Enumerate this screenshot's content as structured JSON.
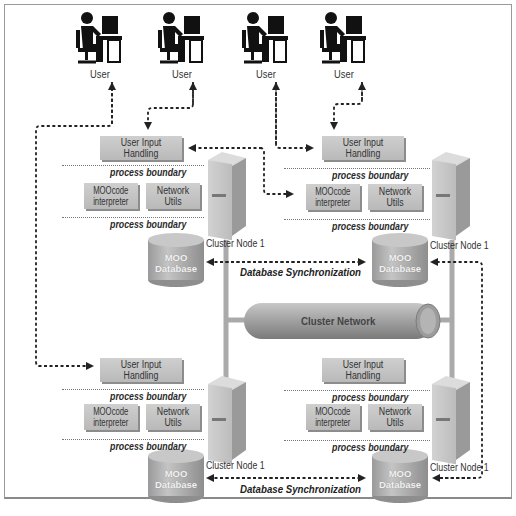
{
  "diagram": {
    "users": [
      {
        "label": "User"
      },
      {
        "label": "User"
      },
      {
        "label": "User"
      },
      {
        "label": "User"
      }
    ],
    "nodes": [
      {
        "id": "top-left",
        "input_box": "User Input Handling",
        "interpreter_box_line1": "MOOcode",
        "interpreter_box_line2": "interpreter",
        "network_box": "Network Utils",
        "boundary_top": "process boundary",
        "boundary_bottom": "process boundary",
        "server_label": "Cluster Node 1",
        "db_line1": "MOO",
        "db_line2": "Database"
      },
      {
        "id": "top-right",
        "input_box": "User Input Handling",
        "interpreter_box_line1": "MOOcode",
        "interpreter_box_line2": "interpreter",
        "network_box": "Network Utils",
        "boundary_top": "process boundary",
        "boundary_bottom": "process boundary",
        "server_label": "Cluster Node 1",
        "db_line1": "MOO",
        "db_line2": "Database"
      },
      {
        "id": "bottom-left",
        "input_box": "User Input Handling",
        "interpreter_box_line1": "MOOcode",
        "interpreter_box_line2": "interpreter",
        "network_box": "Network Utils",
        "boundary_top": "process boundary",
        "boundary_bottom": "process boundary",
        "server_label": "Cluster Node 1",
        "db_line1": "MOO",
        "db_line2": "Database"
      },
      {
        "id": "bottom-right",
        "input_box": "User Input Handling",
        "interpreter_box_line1": "MOOcode",
        "interpreter_box_line2": "interpreter",
        "network_box": "Network Utils",
        "boundary_top": "process boundary",
        "boundary_bottom": "process boundary",
        "server_label": "Cluster Node 1",
        "db_line1": "MOO",
        "db_line2": "Database"
      }
    ],
    "sync_labels": [
      "Database Synchronization",
      "Database Synchronization"
    ],
    "network_label": "Cluster Network",
    "colors": {
      "box_fill": "#c4c4c4",
      "box_shadow": "#8c8c8c",
      "server": "#c8c8c8",
      "pipe": "#a8a8a8",
      "line": "#222222"
    }
  }
}
